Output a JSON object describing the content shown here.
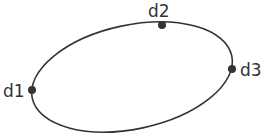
{
  "diagram": {
    "type": "ellipse-with-points",
    "stroke_color": "#333333",
    "background": "#ffffff",
    "ellipse": {
      "cx": 132,
      "cy": 77,
      "rx": 102,
      "ry": 52,
      "rotation_deg": -12
    },
    "points": [
      {
        "id": "d1",
        "label": "d1",
        "x": 32,
        "y": 90,
        "label_x": 3,
        "label_y": 97
      },
      {
        "id": "d2",
        "label": "d2",
        "x": 162,
        "y": 25,
        "label_x": 148,
        "label_y": 17
      },
      {
        "id": "d3",
        "label": "d3",
        "x": 232,
        "y": 69,
        "label_x": 240,
        "label_y": 76
      }
    ]
  }
}
